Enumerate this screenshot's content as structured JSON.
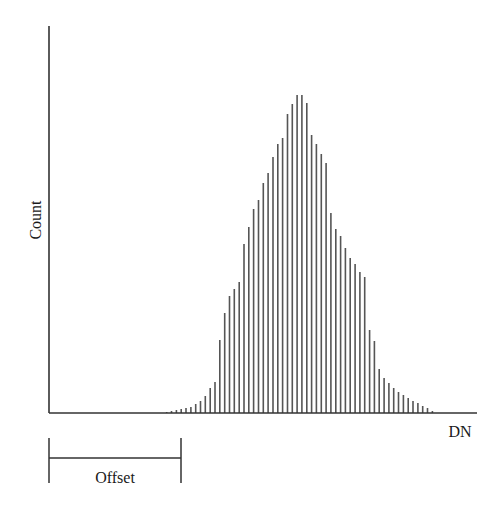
{
  "chart_data": {
    "type": "bar",
    "title": "",
    "xlabel": "DN",
    "ylabel": "Count",
    "annotations": [
      {
        "type": "bracket",
        "label": "Offset",
        "x_start_px": 49,
        "x_end_px": 181
      }
    ],
    "grid": false,
    "legend": null,
    "axis_ticks": "none",
    "note": "Histogram of digital numbers (DN); bar heights in pixel units (relative count), baseline at 0. Bars start after an offset from the origin.",
    "x": [
      166.7,
      171.5,
      176.4,
      181.2,
      186.0,
      190.9,
      195.7,
      200.5,
      205.3,
      210.2,
      215.0,
      219.8,
      224.7,
      229.5,
      234.3,
      239.2,
      244.0,
      248.8,
      253.6,
      258.5,
      263.3,
      268.1,
      273.0,
      277.8,
      282.6,
      287.5,
      292.3,
      297.1,
      301.9,
      306.8,
      311.6,
      316.4,
      321.3,
      326.1,
      330.9,
      335.8,
      340.6,
      345.4,
      350.2,
      355.1,
      359.9,
      364.7,
      369.6,
      374.4,
      379.2,
      384.1,
      388.9,
      393.7,
      398.5,
      403.4,
      408.2,
      413.0,
      417.9,
      422.7,
      427.5,
      432.4
    ],
    "values": [
      1,
      2,
      3,
      4,
      5,
      6,
      9,
      12,
      17,
      25,
      31,
      73,
      100,
      117,
      124,
      131,
      169,
      186,
      204,
      213,
      230,
      240,
      256,
      269,
      275,
      299,
      309,
      318,
      318,
      310,
      278,
      269,
      259,
      250,
      200,
      184,
      177,
      165,
      155,
      149,
      141,
      136,
      83,
      72,
      44,
      35,
      30,
      25,
      21,
      18,
      15,
      12,
      10,
      7,
      5,
      2
    ],
    "ylim": [
      0,
      387
    ]
  },
  "labels": {
    "y_axis": "Count",
    "x_axis": "DN",
    "offset": "Offset"
  },
  "colors": {
    "axis": "#333333",
    "bars": "#555555",
    "text": "#1a1a1a"
  },
  "layout": {
    "origin_x": 49,
    "origin_y": 413,
    "y_axis_top": 26,
    "x_axis_end": 477
  }
}
